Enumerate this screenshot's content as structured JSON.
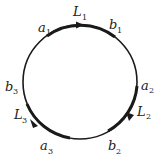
{
  "diagram": {
    "type": "circle-with-oriented-arcs",
    "colors": {
      "stroke": "#1a1a1a",
      "background": "#ffffff"
    },
    "labels": {
      "a1": {
        "base": "a",
        "sub": "1"
      },
      "b1": {
        "base": "b",
        "sub": "1"
      },
      "L1": {
        "base": "L",
        "sub": "1"
      },
      "a2": {
        "base": "a",
        "sub": "2"
      },
      "b2": {
        "base": "b",
        "sub": "2"
      },
      "L2": {
        "base": "L",
        "sub": "2"
      },
      "a3": {
        "base": "a",
        "sub": "3"
      },
      "b3": {
        "base": "b",
        "sub": "3"
      },
      "L3": {
        "base": "L",
        "sub": "3"
      }
    },
    "arcs": [
      {
        "name": "L1",
        "from": "a1",
        "to": "b1",
        "direction": "clockwise"
      },
      {
        "name": "L2",
        "from": "a2",
        "to": "b2",
        "direction": "clockwise"
      },
      {
        "name": "L3",
        "from": "a3",
        "to": "b3",
        "direction": "clockwise"
      }
    ]
  }
}
